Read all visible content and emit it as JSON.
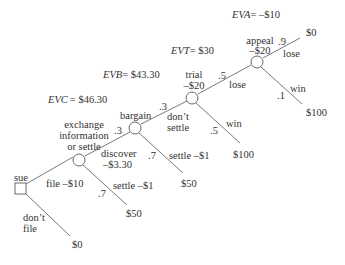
{
  "colors": {
    "line": "#7a7a7a",
    "text": "#333333",
    "background": "#ffffff"
  },
  "nodes": {
    "decision": {
      "label": "sue",
      "shape": "square"
    },
    "exchange": {
      "label_lines": [
        "exchange",
        "information",
        "or settle"
      ],
      "ev_label": "EVC",
      "ev_value": "= $46.30"
    },
    "bargain": {
      "label": "bargain",
      "ev_label": "EVB",
      "ev_value": "= $43.30"
    },
    "trial": {
      "label": "trial",
      "cost": "–$20",
      "ev_label": "EVT",
      "ev_value": "= $30"
    },
    "appeal": {
      "label": "appeal",
      "cost": "–$20",
      "ev_label": "EVA",
      "ev_value": "= –$10"
    }
  },
  "branches": {
    "file": {
      "label": "file –$10"
    },
    "dont_file": {
      "label_lines": [
        "don’t",
        "file"
      ],
      "payoff": "$0"
    },
    "exchange_settle": {
      "prob": ".7",
      "label": "settle –$1",
      "payoff": "$50"
    },
    "discover": {
      "prob": ".3",
      "label_lines": [
        "discover",
        "–$3.30"
      ]
    },
    "bargain_settle": {
      "prob": ".7",
      "label": "settle –$1",
      "payoff": "$50"
    },
    "dont_settle": {
      "prob": ".3",
      "label_lines": [
        "don’t",
        "settle"
      ]
    },
    "trial_win": {
      "prob": ".5",
      "label": "win",
      "payoff": "$100"
    },
    "trial_lose": {
      "prob": ".5",
      "label": "lose"
    },
    "appeal_win": {
      "prob": ".1",
      "label": "win",
      "payoff": "$100"
    },
    "appeal_lose": {
      "prob": ".9",
      "label": "lose",
      "payoff": "$0"
    }
  }
}
